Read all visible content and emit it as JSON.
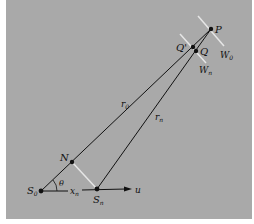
{
  "diagram": {
    "colors": {
      "background": "#a9a9a9",
      "line": "#111111",
      "wavefront": "#e6e6e6"
    },
    "points": {
      "P": {
        "label": "P",
        "x": 211,
        "y": 29
      },
      "Qprime": {
        "label": "Q'",
        "x": 193,
        "y": 47
      },
      "Q": {
        "label": "Q",
        "x": 196,
        "y": 51
      },
      "N": {
        "label": "N",
        "x": 72,
        "y": 162
      },
      "S0": {
        "label": "S",
        "sub": "0",
        "x": 41,
        "y": 191
      },
      "Sn": {
        "label": "S",
        "sub": "n",
        "x": 97,
        "y": 189
      }
    },
    "labels": {
      "r0": {
        "main": "r",
        "sub": "0"
      },
      "rn": {
        "main": "r",
        "sub": "n"
      },
      "W0": {
        "main": "W",
        "sub": "0"
      },
      "Wn": {
        "main": "W",
        "sub": "n"
      },
      "xn": {
        "main": "x",
        "sub": "n"
      },
      "theta": "θ",
      "u": "u"
    }
  }
}
